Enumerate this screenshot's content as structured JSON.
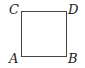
{
  "diagram": {
    "shape": "square",
    "vertices": {
      "top_left": "C",
      "top_right": "D",
      "bottom_left": "A",
      "bottom_right": "B"
    }
  }
}
